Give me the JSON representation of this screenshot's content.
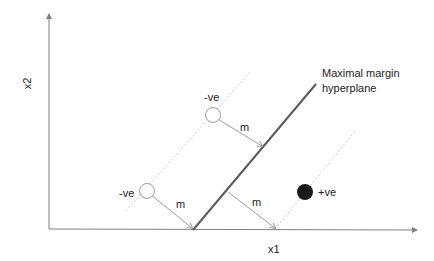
{
  "diagram": {
    "axes": {
      "x_label": "x1",
      "y_label": "x2"
    },
    "hyperplane_label": [
      "Maximal margin",
      "hyperplane"
    ],
    "margin_labels": [
      "m",
      "m",
      "m"
    ],
    "points": [
      {
        "class": "-ve",
        "label": "-ve",
        "style": "hollow-circle"
      },
      {
        "class": "-ve",
        "label": "-ve",
        "style": "hollow-circle"
      },
      {
        "class": "+ve",
        "label": "+ve",
        "style": "filled-circle"
      }
    ],
    "colors": {
      "axis": "#7f7f7f",
      "hyperplane": "#5a5a5a",
      "margin": "#bfbfbf",
      "arrow": "#9e9e9e",
      "positive_point": "#1a1a1a",
      "negative_point_stroke": "#9e9e9e"
    }
  }
}
